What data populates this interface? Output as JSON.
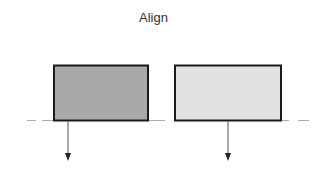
{
  "title": "Align",
  "shapes": [
    {
      "name": "left-box",
      "fill": "#a9a9a9",
      "stroke": "#1a1a1a"
    },
    {
      "name": "right-box",
      "fill": "#e2e2e2",
      "stroke": "#1a1a1a"
    }
  ],
  "baseline": {
    "style": "dashed",
    "color": "#999999"
  },
  "arrows": [
    {
      "direction": "down"
    },
    {
      "direction": "down"
    }
  ]
}
